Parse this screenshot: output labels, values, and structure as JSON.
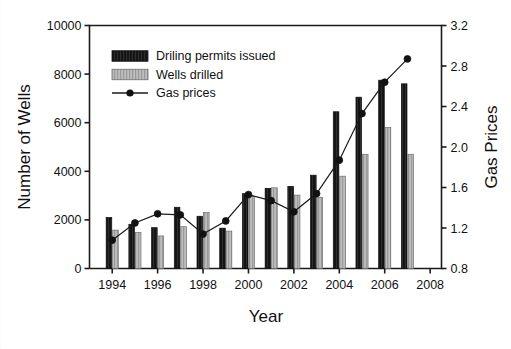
{
  "chart_data": {
    "type": "bar",
    "title": "",
    "xlabel": "Year",
    "ylabel": "Number of Wells",
    "y2label": "Gas Prices",
    "categories": [
      1994,
      1995,
      1996,
      1997,
      1998,
      1999,
      2000,
      2001,
      2002,
      2003,
      2004,
      2005,
      2006,
      2007
    ],
    "xlim": [
      1993,
      2008.5
    ],
    "xticks": [
      1994,
      1996,
      1998,
      2000,
      2002,
      2004,
      2006,
      2008
    ],
    "xticklabels": [
      "1994",
      "1996",
      "1998",
      "2000",
      "2002",
      "2004",
      "2006",
      "2008"
    ],
    "ylim": [
      0,
      10000
    ],
    "yticks": [
      0,
      2000,
      4000,
      6000,
      8000,
      10000
    ],
    "yticklabels": [
      "0",
      "2000",
      "4000",
      "6000",
      "8000",
      "10000"
    ],
    "y2lim": [
      0.8,
      3.2
    ],
    "y2ticks": [
      0.8,
      1.2,
      1.6,
      2.0,
      2.4,
      2.8,
      3.2
    ],
    "y2ticklabels": [
      "0.8",
      "1.2",
      "1.6",
      "2.0",
      "2.4",
      "2.8",
      "3.2"
    ],
    "grid": false,
    "legend_position": "upper-left-inside",
    "series": [
      {
        "name": "Driling permits issued",
        "kind": "bar",
        "axis": "left",
        "color": "#141414",
        "values": [
          2100,
          1820,
          1680,
          2520,
          2150,
          1660,
          3080,
          3300,
          3380,
          3840,
          6450,
          7050,
          7750,
          7600
        ]
      },
      {
        "name": "Wells drilled",
        "kind": "bar",
        "axis": "left",
        "color": "#b5b5b5",
        "values": [
          1580,
          1480,
          1340,
          1720,
          2300,
          1540,
          2960,
          3320,
          3020,
          2930,
          3800,
          4700,
          5800,
          4700
        ]
      },
      {
        "name": "Gas prices",
        "kind": "line",
        "axis": "right",
        "color": "#1a1a1a",
        "marker": "filled-circle",
        "values": [
          1.08,
          1.25,
          1.34,
          1.33,
          1.14,
          1.27,
          1.53,
          1.47,
          1.36,
          1.54,
          1.87,
          2.33,
          2.64,
          2.87
        ]
      }
    ]
  },
  "legend": {
    "items": [
      {
        "label": "Driling permits issued",
        "swatch": "black-bar-swatch"
      },
      {
        "label": "Wells drilled",
        "swatch": "gray-bar-swatch"
      },
      {
        "label": "Gas prices",
        "swatch": "line-marker-swatch"
      }
    ]
  },
  "axes": {
    "left_title": "Number of Wells",
    "right_title": "Gas Prices",
    "bottom_title": "Year"
  }
}
